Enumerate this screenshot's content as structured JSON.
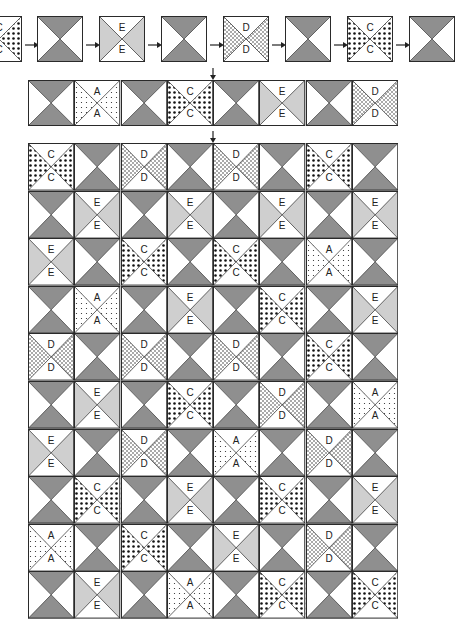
{
  "colors": {
    "dark": "#8f8f8f",
    "light": "#cfcfcf",
    "line": "#2a2a2a",
    "white": "#ffffff"
  },
  "legend": {
    "A": "fine-dot",
    "C": "large-dot",
    "D": "crosshatch",
    "E": "light-gray",
    "X": "plain-hourglass"
  },
  "sequence": {
    "blocks": [
      "C",
      "X",
      "E",
      "X",
      "D",
      "X",
      "C",
      "X"
    ],
    "arrow_glyph": "→"
  },
  "strip": {
    "blocks": [
      "X",
      "A",
      "X",
      "C",
      "X",
      "E",
      "X",
      "D"
    ]
  },
  "down_arrow_glyph": "↓",
  "grid": {
    "rows": [
      [
        "C",
        "X",
        "D",
        "X",
        "D",
        "X",
        "C",
        "X"
      ],
      [
        "X",
        "E",
        "X",
        "E",
        "X",
        "E",
        "X",
        "E"
      ],
      [
        "E",
        "X",
        "C",
        "X",
        "C",
        "X",
        "A",
        "X"
      ],
      [
        "X",
        "A",
        "X",
        "E",
        "X",
        "C",
        "X",
        "E"
      ],
      [
        "D",
        "X",
        "D",
        "X",
        "D",
        "X",
        "C",
        "X"
      ],
      [
        "X",
        "E",
        "X",
        "C",
        "X",
        "D",
        "X",
        "A"
      ],
      [
        "E",
        "X",
        "D",
        "X",
        "A",
        "X",
        "D",
        "X"
      ],
      [
        "X",
        "C",
        "X",
        "E",
        "X",
        "C",
        "X",
        "E"
      ],
      [
        "A",
        "X",
        "C",
        "X",
        "E",
        "X",
        "D",
        "X"
      ],
      [
        "X",
        "E",
        "X",
        "A",
        "X",
        "C",
        "X",
        "C"
      ]
    ]
  }
}
